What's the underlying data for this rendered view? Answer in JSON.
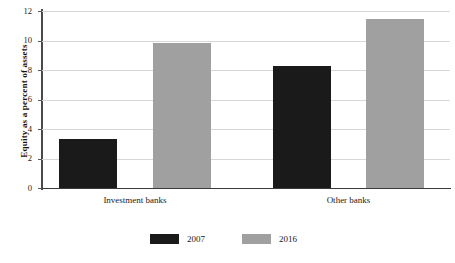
{
  "chart_data": {
    "type": "bar",
    "title": "",
    "subtitle": "",
    "xlabel": "",
    "ylabel": "Equity as a percent of assets",
    "categories": [
      "Investment banks",
      "Other banks"
    ],
    "series": [
      {
        "name": "2007",
        "color": "#1a1a1a",
        "values": [
          3.35,
          8.25
        ]
      },
      {
        "name": "2016",
        "color": "#a0a0a0",
        "values": [
          9.85,
          11.45
        ]
      }
    ],
    "ylim": [
      0,
      12
    ],
    "yticks": [
      0,
      2,
      4,
      6,
      8,
      10,
      12
    ],
    "ytick_labels": [
      "0",
      "2",
      "4",
      "6",
      "8",
      "10",
      "12"
    ],
    "grid": "horizontal",
    "legend_position": "bottom"
  },
  "axis": {
    "y_title": "Equity as a percent of assets",
    "ticks": [
      {
        "label": "12",
        "value": 12
      },
      {
        "label": "10",
        "value": 10
      },
      {
        "label": "8",
        "value": 8
      },
      {
        "label": "6",
        "value": 6
      },
      {
        "label": "4",
        "value": 4
      },
      {
        "label": "2",
        "value": 2
      },
      {
        "label": "0",
        "value": 0
      }
    ]
  },
  "categories": [
    {
      "label": "Investment banks"
    },
    {
      "label": "Other banks"
    }
  ],
  "legend": {
    "items": [
      {
        "label": "2007",
        "color": "#1a1a1a"
      },
      {
        "label": "2016",
        "color": "#a0a0a0"
      }
    ]
  },
  "colors": {
    "series_2007": "#1a1a1a",
    "series_2016": "#a0a0a0",
    "gridline": "#d7d7d7",
    "axis": "#3a3a3a",
    "background": "#ffffff"
  }
}
